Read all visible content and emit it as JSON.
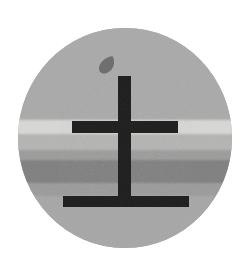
{
  "image": {
    "title": "Circular landscape emblem with cross",
    "width": 252,
    "height": 265,
    "background_color": "#ffffff",
    "alt_text": "Grayscale circular emblem showing banded landscape with a cross and a leaf"
  },
  "disc": {
    "name": "circular-emblem-disc",
    "center_x": 125,
    "center_y": 138,
    "radius_x": 107,
    "radius_y": 110,
    "base_color": "#a8a8a8"
  },
  "bands": [
    {
      "label": "sky-band",
      "y_start": 28,
      "y_end": 120,
      "color": "#a9a9a9"
    },
    {
      "label": "horizon-light-band",
      "y_start": 120,
      "y_end": 134,
      "color": "#d8d8d6"
    },
    {
      "label": "upper-mid-band",
      "y_start": 134,
      "y_end": 150,
      "color": "#b4b4b2"
    },
    {
      "label": "mid-band",
      "y_start": 150,
      "y_end": 160,
      "color": "#9b9b9b"
    },
    {
      "label": "dark-band",
      "y_start": 160,
      "y_end": 183,
      "color": "#7e7e7e"
    },
    {
      "label": "lower-mid-band",
      "y_start": 183,
      "y_end": 196,
      "color": "#9a9a9a"
    },
    {
      "label": "ground-band",
      "y_start": 196,
      "y_end": 248,
      "color": "#a6a6a6"
    }
  ],
  "cross": {
    "name": "cross-figure",
    "color": "#1d1d1d",
    "vertical_stem": {
      "x": 118,
      "y": 76,
      "width": 13,
      "height": 127
    },
    "upper_crossbar": {
      "x": 72,
      "y": 121,
      "width": 106,
      "height": 12
    },
    "lower_basebar": {
      "x": 63,
      "y": 196,
      "width": 126,
      "height": 11
    }
  },
  "leaf": {
    "name": "leaf-shape",
    "color": "#6f6f6f",
    "center_x": 108,
    "center_y": 65,
    "width": 12,
    "height": 19,
    "rotation_deg": 28
  },
  "palette": {
    "ink": "#1d1d1d",
    "light": "#d8d8d6",
    "mid": "#a8a8a8",
    "dark": "#7e7e7e",
    "leaf": "#6f6f6f",
    "page": "#ffffff"
  }
}
